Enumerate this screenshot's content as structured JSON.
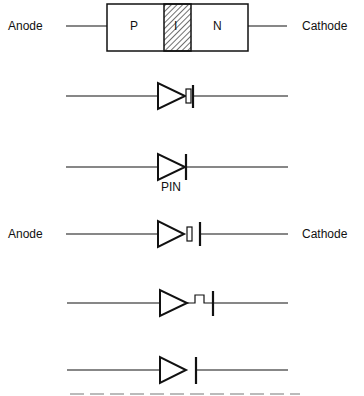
{
  "structure": {
    "left_label": "Anode",
    "right_label": "Cathode",
    "regions": [
      "P",
      "I",
      "N"
    ]
  },
  "symbols": [
    {
      "variant": "diode-with-intrinsic-box"
    },
    {
      "variant": "plain-diode",
      "caption": "PIN"
    },
    {
      "variant": "diode-box-bar",
      "left_label": "Anode",
      "right_label": "Cathode"
    },
    {
      "variant": "diode-step-bar"
    },
    {
      "variant": "diode-gap-bar"
    }
  ],
  "colors": {
    "line": "#111111",
    "background": "#ffffff"
  }
}
